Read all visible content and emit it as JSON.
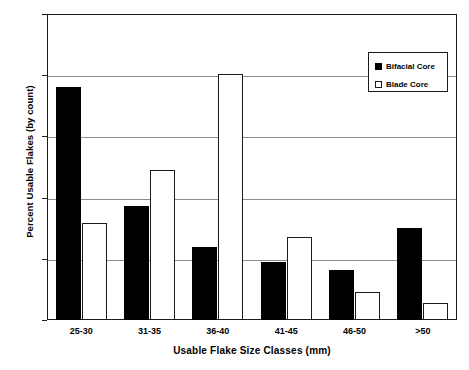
{
  "chart_data": {
    "type": "bar",
    "title": "",
    "xlabel": "Usable Flake Size Classes (mm)",
    "ylabel": "Percent Usable Flakes (by count)",
    "categories": [
      "25-30",
      "31-35",
      "36-40",
      "41-45",
      "46-50",
      ">50"
    ],
    "series": [
      {
        "name": "Bifacial Core",
        "values": [
          38.1,
          18.6,
          12.0,
          9.4,
          8.2,
          15.0
        ],
        "color": "#000000",
        "style": "filled"
      },
      {
        "name": "Blade Core",
        "values": [
          15.8,
          24.5,
          40.2,
          13.5,
          4.5,
          2.7
        ],
        "color": "#ffffff",
        "style": "open"
      }
    ],
    "ylim": [
      0,
      50
    ],
    "yticks": [
      0,
      10,
      20,
      30,
      40,
      50
    ],
    "ytick_labels": [
      "0",
      "10",
      "20",
      "30",
      "40",
      "50"
    ],
    "grid": "horizontal",
    "legend_position": "top-right",
    "legend_entries": [
      "Bifacial Core",
      "Blade Core"
    ]
  }
}
